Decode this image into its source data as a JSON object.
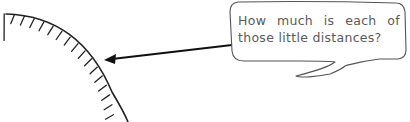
{
  "diagram": {
    "type": "annotated-illustration",
    "arc": {
      "description": "quarter-circle arc with evenly spaced tick marks pointing inward",
      "tick_count": 17,
      "color": "#222222"
    },
    "arrow": {
      "from": "speech-bubble",
      "to": "arc tick spacing",
      "color": "#111111"
    },
    "callout": {
      "text": "How much is each of those little distances?",
      "text_color": "#5a5a5a",
      "border_color": "#555555"
    }
  }
}
